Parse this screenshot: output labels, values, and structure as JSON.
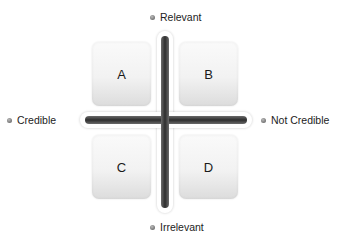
{
  "diagram": {
    "axes": {
      "top": "Relevant",
      "bottom": "Irrelevant",
      "left": "Credible",
      "right": "Not Credible"
    },
    "quadrants": [
      {
        "id": "top-left",
        "label": "A"
      },
      {
        "id": "top-right",
        "label": "B"
      },
      {
        "id": "bottom-left",
        "label": "C"
      },
      {
        "id": "bottom-right",
        "label": "D"
      }
    ],
    "colors": {
      "bar": "#2e2e2e",
      "box_top": "#fafafa",
      "box_bottom": "#dcdcdc",
      "background": "#ffffff"
    }
  }
}
